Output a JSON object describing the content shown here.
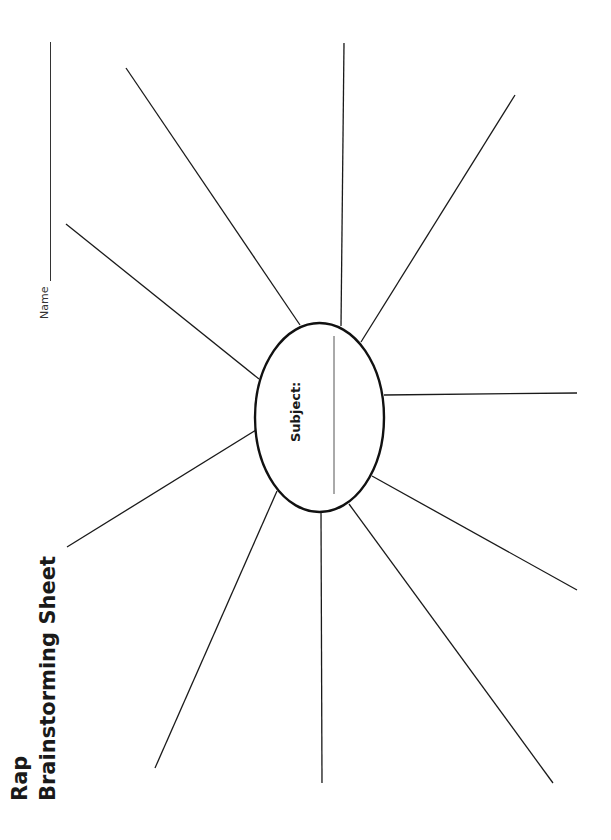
{
  "worksheet": {
    "title_line1": "Rap",
    "title_line2": "Brainstorming Sheet",
    "name_label": "Name",
    "center": {
      "label": "Subject:",
      "shape": "ellipse",
      "cx": 319.5,
      "cy": 417.5,
      "rx": 64.5,
      "ry": 94.5,
      "answer_line": {
        "x1": 334,
        "y1": 336,
        "x2": 334,
        "y2": 494
      }
    },
    "spokes": [
      {
        "id": "top-left-diagonal",
        "x1": 300,
        "y1": 325,
        "x2": 126,
        "y2": 68
      },
      {
        "id": "top-vertical",
        "x1": 341,
        "y1": 326,
        "x2": 344,
        "y2": 43
      },
      {
        "id": "top-right-diagonal",
        "x1": 361,
        "y1": 342,
        "x2": 515,
        "y2": 95
      },
      {
        "id": "right-horizontal",
        "x1": 384,
        "y1": 395,
        "x2": 577,
        "y2": 393
      },
      {
        "id": "lower-right-diagonal",
        "x1": 372,
        "y1": 476,
        "x2": 577,
        "y2": 590
      },
      {
        "id": "bottom-right-diagonal",
        "x1": 349,
        "y1": 504,
        "x2": 553,
        "y2": 783
      },
      {
        "id": "bottom-vertical",
        "x1": 321,
        "y1": 512,
        "x2": 322,
        "y2": 783
      },
      {
        "id": "bottom-left-diagonal",
        "x1": 277,
        "y1": 491,
        "x2": 155,
        "y2": 768
      },
      {
        "id": "left-lower-diagonal",
        "x1": 256,
        "y1": 430,
        "x2": 67,
        "y2": 547
      },
      {
        "id": "left-upper-diagonal",
        "x1": 259,
        "y1": 379,
        "x2": 66,
        "y2": 224
      }
    ],
    "colors": {
      "ink": "#1a1a1a",
      "background": "#ffffff"
    }
  }
}
